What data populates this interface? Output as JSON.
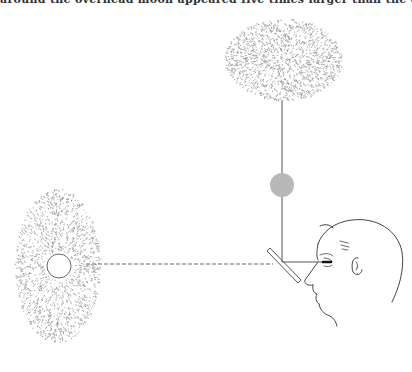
{
  "caption": "around the overhead moon appeared five times larger than the one straight ahead.",
  "figure": {
    "elements": {
      "overhead_sky_label": "overhead sky (stippled)",
      "overhead_moon_label": "overhead moon (gray disc)",
      "horizon_sky_label": "horizon sky (stippled)",
      "horizon_moon_label": "horizon moon (white disc)",
      "mirror_label": "angled mirror",
      "observer_label": "observer head"
    },
    "colors": {
      "stipple": "#8a8a8a",
      "overhead_moon": "#b8b8b8",
      "line": "#555555"
    }
  }
}
